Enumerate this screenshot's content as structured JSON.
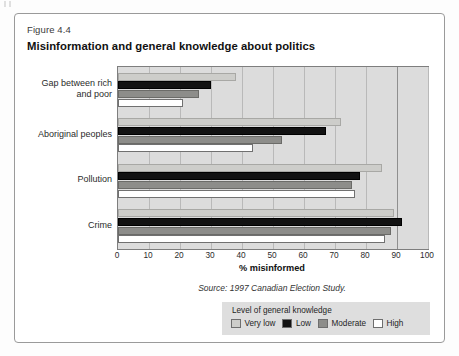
{
  "figure": {
    "number_label": "Figure 4.4",
    "title": "Misinformation and general knowledge about politics",
    "source": "Source: 1997 Canadian Election Study."
  },
  "legend": {
    "title": "Level of general knowledge",
    "items": [
      {
        "label": "Very low",
        "color": "#cdcdca"
      },
      {
        "label": "Low",
        "color": "#121212"
      },
      {
        "label": "Moderate",
        "color": "#8d8d8a"
      },
      {
        "label": "High",
        "color": "#ffffff"
      }
    ]
  },
  "chart_data": {
    "type": "bar",
    "orientation": "horizontal",
    "title": "Misinformation and general knowledge about politics",
    "xlabel": "% misinformed",
    "ylabel": "",
    "xlim": [
      0,
      100
    ],
    "xticks": [
      0,
      10,
      20,
      30,
      40,
      50,
      60,
      70,
      80,
      90,
      100
    ],
    "grid": true,
    "legend_position": "bottom-right",
    "legend_title": "Level of general knowledge",
    "categories": [
      "Gap between rich and poor",
      "Aboriginal peoples",
      "Pollution",
      "Crime"
    ],
    "series": [
      {
        "name": "Very low",
        "color": "#cdcdca",
        "values": [
          38,
          72,
          85,
          89
        ]
      },
      {
        "name": "Low",
        "color": "#121212",
        "values": [
          30,
          67,
          78,
          91.5
        ]
      },
      {
        "name": "Moderate",
        "color": "#8d8d8a",
        "values": [
          26,
          53,
          75.5,
          88
        ]
      },
      {
        "name": "High",
        "color": "#ffffff",
        "values": [
          21,
          43.5,
          76.5,
          86
        ]
      }
    ],
    "category_labels_wrapped": [
      [
        "Gap between rich",
        "and poor"
      ],
      [
        "Aboriginal peoples"
      ],
      [
        "Pollution"
      ],
      [
        "Crime"
      ]
    ]
  }
}
